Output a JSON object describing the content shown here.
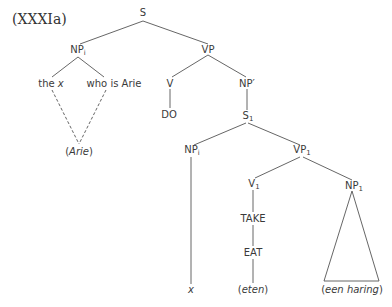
{
  "title": "(XXXIa)",
  "tree": {
    "S": "S",
    "NPi_top": {
      "base": "NP",
      "sub": "i"
    },
    "VP": "VP",
    "the_x": {
      "word": "the",
      "var": "x"
    },
    "who_is_arie": "who is Arie",
    "arie_paren": {
      "open": "(",
      "word": "Arie",
      "close": ")"
    },
    "V": "V",
    "DO": "DO",
    "NP_prime": "NP′",
    "S1": {
      "base": "S",
      "sub": "1"
    },
    "NPi_low": {
      "base": "NP",
      "sub": "i"
    },
    "VP1": {
      "base": "VP",
      "sub": "1"
    },
    "V1": {
      "base": "V",
      "sub": "1"
    },
    "NP1": {
      "base": "NP",
      "sub": "1"
    },
    "TAKE": "TAKE",
    "EAT": "EAT",
    "x_leaf": "x",
    "eten": {
      "open": "(",
      "word": "eten",
      "close": ")"
    },
    "een_haring": {
      "open": "(",
      "word": "een haring",
      "close": ")"
    }
  }
}
